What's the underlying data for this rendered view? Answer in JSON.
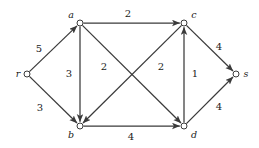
{
  "diagram": {
    "type": "directed-weighted-graph",
    "stroke_color": "#3a3a3a",
    "text_color": "#1a1a1a",
    "background_color": "#ffffff",
    "nodes": [
      {
        "id": "r",
        "label": "r",
        "x": 27,
        "y": 74,
        "label_x": 18,
        "label_y": 77,
        "label_anchor": "middle"
      },
      {
        "id": "a",
        "label": "a",
        "x": 80,
        "y": 23,
        "label_x": 71,
        "label_y": 18,
        "label_anchor": "middle"
      },
      {
        "id": "b",
        "label": "b",
        "x": 80,
        "y": 126,
        "label_x": 71,
        "label_y": 138,
        "label_anchor": "middle"
      },
      {
        "id": "c",
        "label": "c",
        "x": 184,
        "y": 23,
        "label_x": 194,
        "label_y": 18,
        "label_anchor": "middle"
      },
      {
        "id": "d",
        "label": "d",
        "x": 184,
        "y": 126,
        "label_x": 194,
        "label_y": 138,
        "label_anchor": "middle"
      },
      {
        "id": "s",
        "label": "s",
        "x": 236,
        "y": 74,
        "label_x": 246,
        "label_y": 77,
        "label_anchor": "middle"
      }
    ],
    "edges": [
      {
        "from": "r",
        "to": "a",
        "weight": "5",
        "label_x": 39,
        "label_y": 52
      },
      {
        "from": "r",
        "to": "b",
        "weight": "3",
        "label_x": 40,
        "label_y": 111
      },
      {
        "from": "a",
        "to": "c",
        "weight": "2",
        "label_x": 128,
        "label_y": 17
      },
      {
        "from": "a",
        "to": "b",
        "weight": "3",
        "label_x": 69,
        "label_y": 77
      },
      {
        "from": "a",
        "to": "d",
        "weight": "2",
        "label_x": 104,
        "label_y": 70
      },
      {
        "from": "c",
        "to": "b",
        "weight": "2",
        "label_x": 161,
        "label_y": 70
      },
      {
        "from": "d",
        "to": "c",
        "weight": "1",
        "label_x": 195,
        "label_y": 77
      },
      {
        "from": "b",
        "to": "d",
        "weight": "4",
        "label_x": 131,
        "label_y": 140
      },
      {
        "from": "c",
        "to": "s",
        "weight": "4",
        "label_x": 219,
        "label_y": 50
      },
      {
        "from": "d",
        "to": "s",
        "weight": "4",
        "label_x": 219,
        "label_y": 110
      }
    ]
  }
}
